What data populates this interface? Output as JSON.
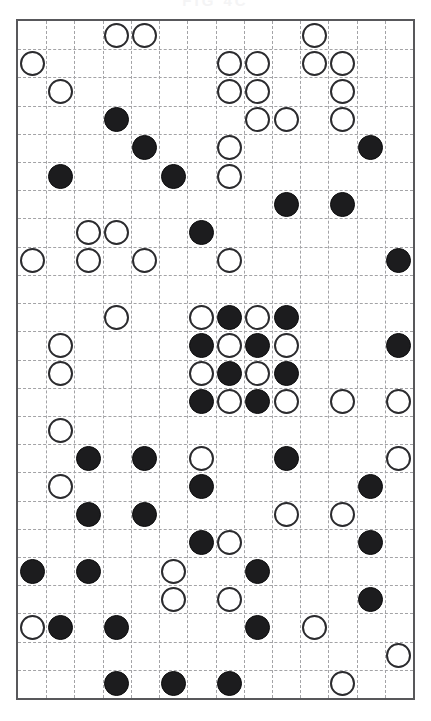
{
  "header": {
    "title": "FIG 4C",
    "title_color": "#f4f4f5"
  },
  "board": {
    "name": "stone-grid-board",
    "columns": 14,
    "rows": 24,
    "cell_size_px": 28.5,
    "origin": {
      "x": 16,
      "y": 19
    },
    "border_color": "#58585b",
    "gridline_color": "#a3a3a6",
    "gridline_style": "dashed",
    "background_color": "#ffffff",
    "black_stone_color": "#1c1c1e",
    "white_stone_color": "#ffffff",
    "white_stone_border_color": "#2b2b2e",
    "stone_diameter_px": 25,
    "legend": [
      {
        "symbol": "filled-circle",
        "name": "black-stone",
        "color": "#1c1c1e"
      },
      {
        "symbol": "open-circle",
        "name": "white-stone",
        "color": "#ffffff"
      }
    ],
    "counts": {
      "black": 56,
      "white": 58,
      "total": 114
    },
    "stones": [
      {
        "col": 3,
        "row": 0,
        "type": "white"
      },
      {
        "col": 4,
        "row": 0,
        "type": "white"
      },
      {
        "col": 10,
        "row": 0,
        "type": "white"
      },
      {
        "col": 0,
        "row": 1,
        "type": "white"
      },
      {
        "col": 7,
        "row": 1,
        "type": "white"
      },
      {
        "col": 8,
        "row": 1,
        "type": "white"
      },
      {
        "col": 10,
        "row": 1,
        "type": "white"
      },
      {
        "col": 11,
        "row": 1,
        "type": "white"
      },
      {
        "col": 1,
        "row": 2,
        "type": "white"
      },
      {
        "col": 7,
        "row": 2,
        "type": "white"
      },
      {
        "col": 8,
        "row": 2,
        "type": "white"
      },
      {
        "col": 11,
        "row": 2,
        "type": "white"
      },
      {
        "col": 3,
        "row": 3,
        "type": "black"
      },
      {
        "col": 8,
        "row": 3,
        "type": "white"
      },
      {
        "col": 9,
        "row": 3,
        "type": "white"
      },
      {
        "col": 11,
        "row": 3,
        "type": "white"
      },
      {
        "col": 4,
        "row": 4,
        "type": "black"
      },
      {
        "col": 7,
        "row": 4,
        "type": "white"
      },
      {
        "col": 12,
        "row": 4,
        "type": "black"
      },
      {
        "col": 1,
        "row": 5,
        "type": "black"
      },
      {
        "col": 5,
        "row": 5,
        "type": "black"
      },
      {
        "col": 7,
        "row": 5,
        "type": "white"
      },
      {
        "col": 9,
        "row": 6,
        "type": "black"
      },
      {
        "col": 11,
        "row": 6,
        "type": "black"
      },
      {
        "col": 2,
        "row": 7,
        "type": "white"
      },
      {
        "col": 3,
        "row": 7,
        "type": "white"
      },
      {
        "col": 6,
        "row": 7,
        "type": "black"
      },
      {
        "col": 0,
        "row": 8,
        "type": "white"
      },
      {
        "col": 2,
        "row": 8,
        "type": "white"
      },
      {
        "col": 4,
        "row": 8,
        "type": "white"
      },
      {
        "col": 7,
        "row": 8,
        "type": "white"
      },
      {
        "col": 13,
        "row": 8,
        "type": "black"
      },
      {
        "col": 3,
        "row": 10,
        "type": "white"
      },
      {
        "col": 6,
        "row": 10,
        "type": "white"
      },
      {
        "col": 7,
        "row": 10,
        "type": "black"
      },
      {
        "col": 8,
        "row": 10,
        "type": "white"
      },
      {
        "col": 9,
        "row": 10,
        "type": "black"
      },
      {
        "col": 1,
        "row": 11,
        "type": "white"
      },
      {
        "col": 6,
        "row": 11,
        "type": "black"
      },
      {
        "col": 7,
        "row": 11,
        "type": "white"
      },
      {
        "col": 8,
        "row": 11,
        "type": "black"
      },
      {
        "col": 9,
        "row": 11,
        "type": "white"
      },
      {
        "col": 13,
        "row": 11,
        "type": "black"
      },
      {
        "col": 1,
        "row": 12,
        "type": "white"
      },
      {
        "col": 6,
        "row": 12,
        "type": "white"
      },
      {
        "col": 7,
        "row": 12,
        "type": "black"
      },
      {
        "col": 8,
        "row": 12,
        "type": "white"
      },
      {
        "col": 9,
        "row": 12,
        "type": "black"
      },
      {
        "col": 6,
        "row": 13,
        "type": "black"
      },
      {
        "col": 7,
        "row": 13,
        "type": "white"
      },
      {
        "col": 8,
        "row": 13,
        "type": "black"
      },
      {
        "col": 9,
        "row": 13,
        "type": "white"
      },
      {
        "col": 11,
        "row": 13,
        "type": "white"
      },
      {
        "col": 13,
        "row": 13,
        "type": "white"
      },
      {
        "col": 1,
        "row": 14,
        "type": "white"
      },
      {
        "col": 2,
        "row": 15,
        "type": "black"
      },
      {
        "col": 4,
        "row": 15,
        "type": "black"
      },
      {
        "col": 6,
        "row": 15,
        "type": "white"
      },
      {
        "col": 9,
        "row": 15,
        "type": "black"
      },
      {
        "col": 13,
        "row": 15,
        "type": "white"
      },
      {
        "col": 1,
        "row": 16,
        "type": "white"
      },
      {
        "col": 6,
        "row": 16,
        "type": "black"
      },
      {
        "col": 12,
        "row": 16,
        "type": "black"
      },
      {
        "col": 2,
        "row": 17,
        "type": "black"
      },
      {
        "col": 4,
        "row": 17,
        "type": "black"
      },
      {
        "col": 9,
        "row": 17,
        "type": "white"
      },
      {
        "col": 11,
        "row": 17,
        "type": "white"
      },
      {
        "col": 6,
        "row": 18,
        "type": "black"
      },
      {
        "col": 7,
        "row": 18,
        "type": "white"
      },
      {
        "col": 12,
        "row": 18,
        "type": "black"
      },
      {
        "col": 0,
        "row": 19,
        "type": "black"
      },
      {
        "col": 2,
        "row": 19,
        "type": "black"
      },
      {
        "col": 5,
        "row": 19,
        "type": "white"
      },
      {
        "col": 8,
        "row": 19,
        "type": "black"
      },
      {
        "col": 5,
        "row": 20,
        "type": "white"
      },
      {
        "col": 7,
        "row": 20,
        "type": "white"
      },
      {
        "col": 12,
        "row": 20,
        "type": "black"
      },
      {
        "col": 0,
        "row": 21,
        "type": "white"
      },
      {
        "col": 1,
        "row": 21,
        "type": "black"
      },
      {
        "col": 3,
        "row": 21,
        "type": "black"
      },
      {
        "col": 8,
        "row": 21,
        "type": "black"
      },
      {
        "col": 10,
        "row": 21,
        "type": "white"
      },
      {
        "col": 13,
        "row": 22,
        "type": "white"
      },
      {
        "col": 3,
        "row": 23,
        "type": "black"
      },
      {
        "col": 5,
        "row": 23,
        "type": "black"
      },
      {
        "col": 7,
        "row": 23,
        "type": "black"
      },
      {
        "col": 11,
        "row": 23,
        "type": "white"
      }
    ]
  }
}
